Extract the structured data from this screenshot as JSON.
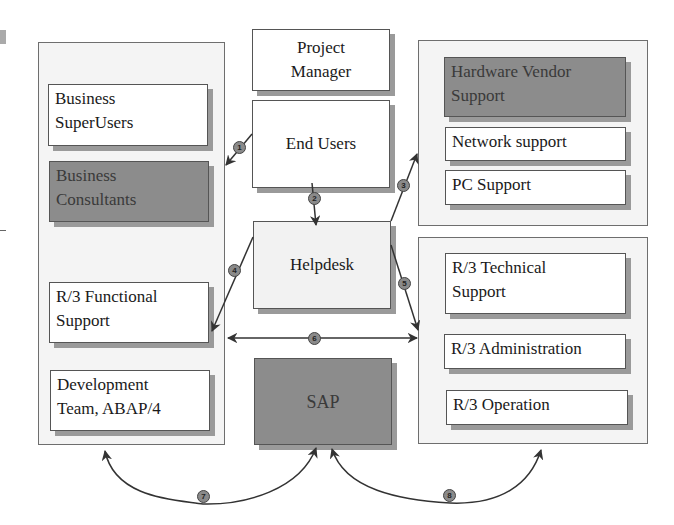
{
  "diagram": {
    "left_panel": {
      "boxes": [
        {
          "id": "business-superusers",
          "lines": [
            "Business",
            "SuperUsers"
          ],
          "style": "white"
        },
        {
          "id": "business-consultants",
          "lines": [
            "Business",
            "Consultants"
          ],
          "style": "dark"
        },
        {
          "id": "r3-functional-support",
          "lines": [
            "R/3 Functional",
            "Support"
          ],
          "style": "white"
        },
        {
          "id": "development-team",
          "lines": [
            "Development",
            "Team, ABAP/4"
          ],
          "style": "white"
        }
      ]
    },
    "center": {
      "project_manager": [
        "Project",
        "Manager"
      ],
      "end_users": "End Users",
      "helpdesk": "Helpdesk",
      "sap": "SAP"
    },
    "right_top_panel": {
      "boxes": [
        {
          "id": "hardware-vendor-support",
          "lines": [
            "Hardware Vendor",
            "Support"
          ],
          "style": "dark"
        },
        {
          "id": "network-support",
          "lines": [
            "Network support"
          ],
          "style": "white"
        },
        {
          "id": "pc-support",
          "lines": [
            "PC Support"
          ],
          "style": "white"
        }
      ]
    },
    "right_bottom_panel": {
      "boxes": [
        {
          "id": "r3-technical-support",
          "lines": [
            "R/3 Technical",
            "Support"
          ],
          "style": "white"
        },
        {
          "id": "r3-administration",
          "lines": [
            "R/3 Administration"
          ],
          "style": "white"
        },
        {
          "id": "r3-operation",
          "lines": [
            "R/3 Operation"
          ],
          "style": "white"
        }
      ]
    },
    "flow_labels": [
      "1",
      "2",
      "3",
      "4",
      "5",
      "6",
      "7",
      "8"
    ],
    "colors": {
      "panel_bg": "#f4f4f4",
      "dark_box": "#8c8c8c",
      "shadow": "#9a9a9a",
      "badge": "#8a8a8a",
      "line": "#333333"
    }
  }
}
